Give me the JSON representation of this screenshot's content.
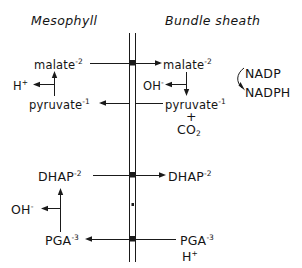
{
  "figure": {
    "type": "diagram",
    "headers": {
      "left": "Mesophyll",
      "right": "Bundle sheath"
    },
    "membrane": {
      "name": "cell-boundary",
      "style": "double-vertical-line",
      "transport-nodes": 3
    },
    "rows": [
      {
        "id": "malate-pyruvate-shuttle",
        "left": {
          "metabolite_top": "malate",
          "metabolite_top_charge": "-2",
          "metabolite_bottom": "pyruvate",
          "metabolite_bottom_charge": "-1",
          "released": "H",
          "released_charge": "+"
        },
        "right": {
          "metabolite_top": "malate",
          "metabolite_top_charge": "-2",
          "metabolite_bottom": "pyruvate",
          "metabolite_bottom_charge": "-1",
          "released": "OH",
          "released_charge": "-",
          "plus": "+",
          "product": "CO",
          "product_sub": "2"
        },
        "cofactor": {
          "oxidized": "NADP",
          "reduced": "NADPH"
        }
      },
      {
        "id": "dhap-shuttle",
        "left": {
          "metabolite": "DHAP",
          "charge": "-2"
        },
        "right": {
          "metabolite": "DHAP",
          "charge": "-2"
        }
      },
      {
        "id": "pga-shuttle",
        "left": {
          "metabolite": "PGA",
          "charge": "-3",
          "released": "OH",
          "released_charge": "-"
        },
        "right": {
          "metabolite": "PGA",
          "charge": "-3",
          "cotransport": "H",
          "cotransport_charge": "+"
        }
      }
    ],
    "colors": {
      "ink": "#1a1a1a",
      "background": "#ffffff"
    }
  }
}
